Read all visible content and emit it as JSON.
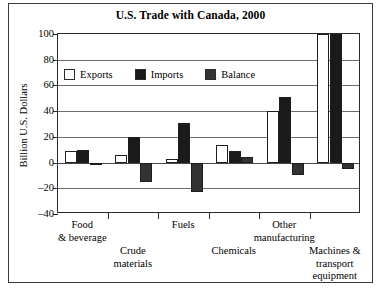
{
  "chart_data": {
    "type": "bar",
    "title": "U.S. Trade with Canada, 2000",
    "xlabel": "",
    "ylabel": "Billion U.S. Dollars",
    "ylim": [
      -40,
      100
    ],
    "yticks": [
      100,
      80,
      60,
      40,
      20,
      0,
      -20,
      -40
    ],
    "ytick_labels": [
      "100",
      "80",
      "60",
      "40",
      "20",
      "0",
      "–20",
      "–40"
    ],
    "grid": true,
    "legend_position": "upper-left-inside",
    "categories": [
      "Food & beverage",
      "Crude materials",
      "Fuels",
      "Chemicals",
      "Other manufacturing",
      "Machines & transport equipment"
    ],
    "category_lines": [
      [
        "Food",
        "& beverage"
      ],
      [
        "Crude",
        "materials"
      ],
      [
        "Fuels"
      ],
      [
        "Chemicals"
      ],
      [
        "Other",
        "manufacturing"
      ],
      [
        "Machines &",
        "transport",
        "equipment"
      ]
    ],
    "series": [
      {
        "name": "Exports",
        "color": "#ffffff",
        "values": [
          9,
          6,
          3,
          14,
          40,
          100
        ]
      },
      {
        "name": "Imports",
        "color": "#1a1a1a",
        "values": [
          10,
          20,
          31,
          9,
          51,
          105
        ]
      },
      {
        "name": "Balance",
        "color": "#333333",
        "values": [
          -1,
          -15,
          -23,
          4,
          -10,
          -5
        ]
      }
    ]
  },
  "legend": {
    "items": [
      {
        "label": "Exports",
        "color": "#ffffff"
      },
      {
        "label": "Imports",
        "color": "#1a1a1a"
      },
      {
        "label": "Balance",
        "color": "#333333"
      }
    ]
  }
}
